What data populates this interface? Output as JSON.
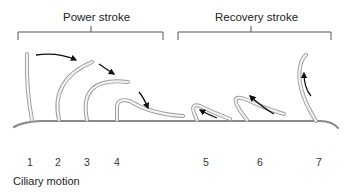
{
  "brackets": {
    "power": {
      "label": "Power stroke"
    },
    "recovery": {
      "label": "Recovery stroke"
    }
  },
  "positions": [
    "1",
    "2",
    "3",
    "4",
    "5",
    "6",
    "7"
  ],
  "caption": "Ciliary motion",
  "colors": {
    "cilium_fill": "#f2f2f2",
    "cilium_edge": "#9a9a9a",
    "arrow": "#111111",
    "bracket": "#555555",
    "surface": "#8a8a8a"
  }
}
